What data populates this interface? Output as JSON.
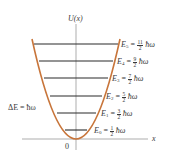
{
  "diagram": {
    "y_axis_label": "U(x)",
    "x_axis_label": "x",
    "origin_label": "0",
    "spacing_label": "ΔE = ħω",
    "curve_color": "#c8753a",
    "level_color": "#2a2a2a",
    "levels": [
      {
        "name": "E",
        "sub": "0",
        "num": "1",
        "den": "2",
        "unit": "ħω"
      },
      {
        "name": "E",
        "sub": "1",
        "num": "3",
        "den": "2",
        "unit": "ħω"
      },
      {
        "name": "E",
        "sub": "2",
        "num": "5",
        "den": "2",
        "unit": "ħω"
      },
      {
        "name": "E",
        "sub": "3",
        "num": "7",
        "den": "2",
        "unit": "ħω"
      },
      {
        "name": "E",
        "sub": "4",
        "num": "9",
        "den": "2",
        "unit": "ħω"
      },
      {
        "name": "E",
        "sub": "5",
        "num": "11",
        "den": "2",
        "unit": "ħω"
      }
    ]
  }
}
